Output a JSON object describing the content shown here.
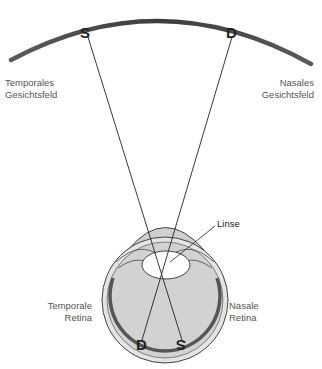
{
  "diagram": {
    "visual_field": {
      "letters": {
        "left": "S",
        "right": "D"
      }
    },
    "labels": {
      "temporal_field": {
        "line1": "Temporales",
        "line2": "Gesichtsfeld"
      },
      "nasal_field": {
        "line1": "Nasales",
        "line2": "Gesichtsfeld"
      },
      "lens": "Linse",
      "temporal_retina": {
        "line1": "Temporale",
        "line2": "Retina"
      },
      "nasal_retina": {
        "line1": "Nasale",
        "line2": "Retina"
      }
    },
    "retina_image": {
      "letters": {
        "left": "D",
        "right": "S"
      },
      "note": "mirrored"
    },
    "colors": {
      "arc": "#4a4a4a",
      "eye_fill": "#d4d4d4",
      "eye_outline": "#444444",
      "retina": "#555555",
      "lens": "#ffffff",
      "label_text": "#555555"
    }
  }
}
